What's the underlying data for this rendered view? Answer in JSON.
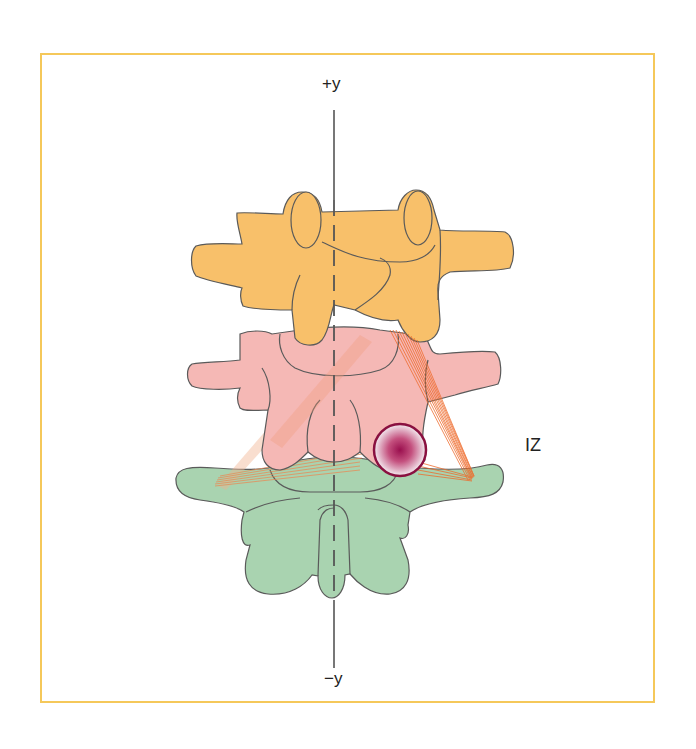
{
  "figure": {
    "axis": {
      "top_label": "+y",
      "bottom_label": "−y"
    },
    "zone_label": "IZ",
    "colors": {
      "frame": "#F5C85A",
      "upper_vertebra": "#F8C06A",
      "middle_vertebra": "#F5B8B5",
      "lower_vertebra": "#A9D3B0",
      "ligament_fibers": "#EE6A2A",
      "lesion_center": "#9A0F4E",
      "lesion_ring": "#8A1040",
      "outline": "#5a5a5a",
      "axis": "#555555"
    },
    "elements": [
      {
        "name": "upper-vertebra",
        "color": "orange"
      },
      {
        "name": "middle-vertebra",
        "color": "pink"
      },
      {
        "name": "lower-vertebra",
        "color": "green"
      },
      {
        "name": "ligament-fibers",
        "color": "orange-red"
      },
      {
        "name": "lesion-circle",
        "color": "crimson radial gradient"
      },
      {
        "name": "vertical-y-axis",
        "style": "dashed over vertebrae, solid outside"
      }
    ]
  }
}
